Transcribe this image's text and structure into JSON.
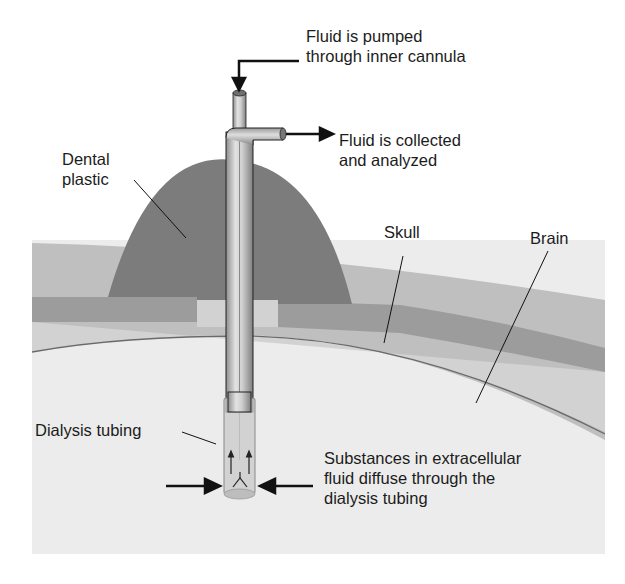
{
  "diagram": {
    "type": "microdialysis-schematic",
    "labels": {
      "pump": [
        "Fluid is pumped",
        "through inner cannula"
      ],
      "collect": [
        "Fluid is collected",
        "and analyzed"
      ],
      "dental": [
        "Dental",
        "plastic"
      ],
      "skull": "Skull",
      "brain": "Brain",
      "tubing": "Dialysis tubing",
      "diffuse": [
        "Substances in extracellular",
        "fluid diffuse through the",
        "dialysis tubing"
      ]
    },
    "colors": {
      "background": "#ffffff",
      "scalp": "#bdbdbd",
      "dental_plastic": "#7a7a7a",
      "skull": "#9a9a9a",
      "meninges": "#cfcfcf",
      "brain": "#ececec",
      "cannula": "#c4c4c4",
      "ink": "#111111"
    }
  }
}
